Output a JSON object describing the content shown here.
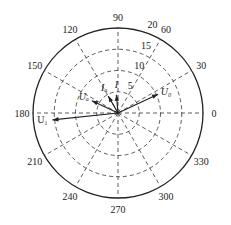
{
  "chart_data": {
    "type": "polar",
    "title": "",
    "radial_ticks": [
      5,
      10,
      15,
      20
    ],
    "radial_max": 20,
    "angle_ticks": [
      0,
      30,
      60,
      90,
      120,
      150,
      180,
      210,
      240,
      270,
      300,
      330
    ],
    "angle_tick_labels": [
      "0",
      "30",
      "60",
      "90",
      "120",
      "150",
      "180",
      "210",
      "240",
      "270",
      "300",
      "330"
    ],
    "radial_tick_labels": [
      "5",
      "10",
      "15",
      "20"
    ],
    "grid": true,
    "grid_style": "dashed",
    "series": [
      {
        "name": "U1",
        "label": "U₁",
        "magnitude": 15.5,
        "angle_deg": 186
      },
      {
        "name": "U0",
        "label": "U₀",
        "magnitude": 10.4,
        "angle_deg": 25
      },
      {
        "name": "Ua",
        "label": "Uₐ",
        "magnitude": 6.8,
        "angle_deg": 155
      },
      {
        "name": "Ia",
        "label": "Iₐ",
        "magnitude": 4.6,
        "angle_deg": 120
      },
      {
        "name": "I",
        "label": "I",
        "magnitude": 4.3,
        "angle_deg": 95
      }
    ]
  },
  "colors": {
    "axis": "#222222",
    "grid": "#333333",
    "vector": "#222222"
  }
}
